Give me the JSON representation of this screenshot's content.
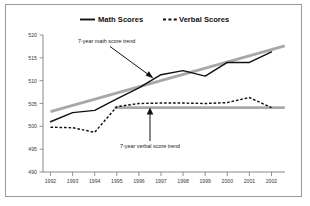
{
  "chart_data": {
    "type": "line",
    "title": "",
    "xlabel": "",
    "ylabel": "",
    "x": [
      1992,
      1993,
      1994,
      1995,
      1996,
      1997,
      1998,
      1999,
      2000,
      2001,
      2002
    ],
    "categories": [
      "1992",
      "1993",
      "1994",
      "1995",
      "1996",
      "1997",
      "1998",
      "1999",
      "2000",
      "2001",
      "2002"
    ],
    "xtick_labels": [
      "1992",
      "1993",
      "1994",
      "1995",
      "1996",
      "1997",
      "1998",
      "1999",
      "2000",
      "2001",
      "2002"
    ],
    "ytick_labels": [
      "520",
      "515",
      "510",
      "505",
      "500",
      "495",
      "490"
    ],
    "yticks": [
      520,
      515,
      510,
      505,
      500,
      495,
      490
    ],
    "ylim": [
      490,
      520
    ],
    "xlim": [
      1991.5,
      2002.8
    ],
    "grid": false,
    "legend_position": "top-center",
    "series": [
      {
        "name": "Math Scores",
        "style": "solid",
        "color": "#111111",
        "values": [
          501.0,
          503.0,
          503.5,
          506.0,
          508.4,
          511.3,
          512.2,
          511.0,
          514.0,
          514.0,
          516.3
        ]
      },
      {
        "name": "Verbal Scores",
        "style": "dashed",
        "color": "#111111",
        "values": [
          499.8,
          499.7,
          498.7,
          504.3,
          505.0,
          505.1,
          505.1,
          505.0,
          505.2,
          506.3,
          504.1
        ]
      }
    ],
    "trend_lines": [
      {
        "name": "7-year math score trend",
        "color": "#a8a8a8",
        "x_start": 1992.0,
        "x_end": 2002.6,
        "y_start": 503.2,
        "y_end": 517.6
      },
      {
        "name": "7-year verbal score trend",
        "color": "#a8a8a8",
        "x_start": 1994.9,
        "x_end": 2002.6,
        "y_start": 504.1,
        "y_end": 504.1
      }
    ],
    "annotations": [
      {
        "text": "7-year math score trend",
        "points_to": "math-trend-line"
      },
      {
        "text": "7-year verbal score trend",
        "points_to": "verbal-trend-line"
      }
    ],
    "legend": [
      {
        "label": "Math Scores",
        "style": "solid"
      },
      {
        "label": "Verbal Scores",
        "style": "dashed"
      }
    ]
  },
  "colors": {
    "series": "#111111",
    "trend": "#a8a8a8",
    "axis": "#7a7a7a",
    "frame": "#9a9a9a",
    "background": "#ffffff"
  }
}
